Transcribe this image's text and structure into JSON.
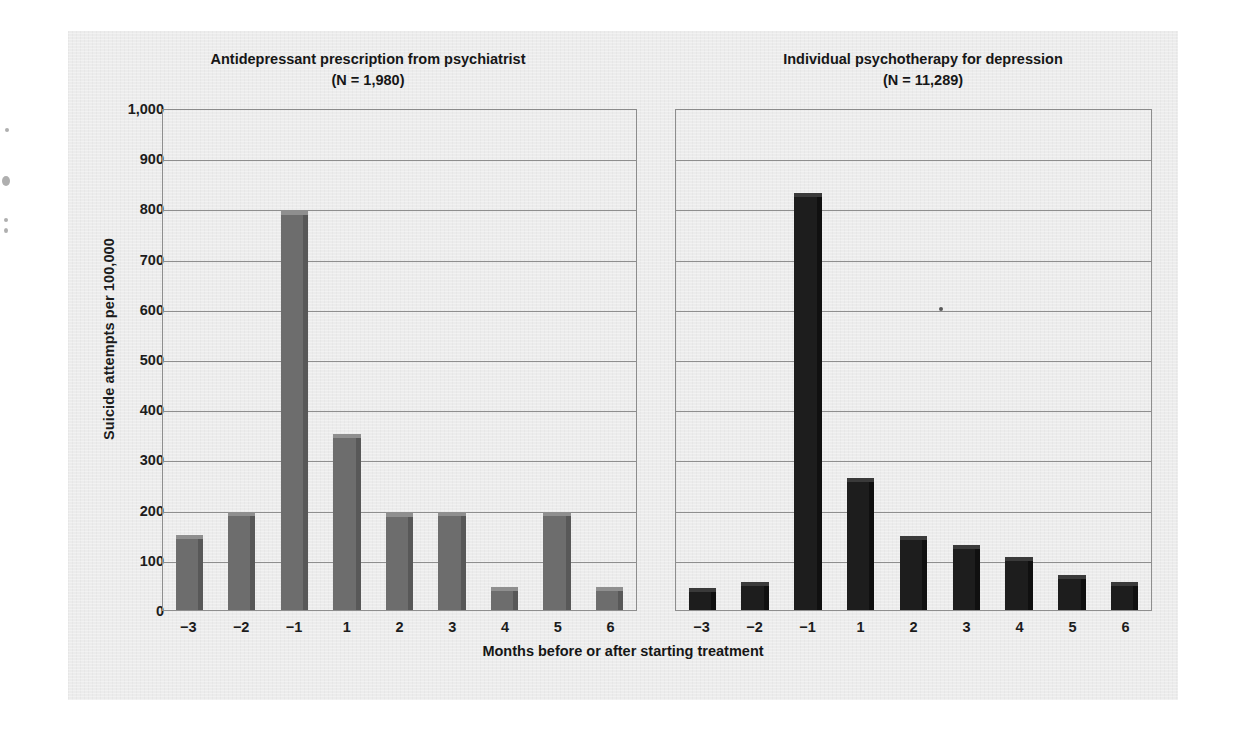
{
  "figure": {
    "y_axis_title": "Suicide attempts per 100,000",
    "x_axis_title": "Months before or after starting treatment"
  },
  "chart_data": [
    {
      "type": "bar",
      "title": "Antidepressant prescription from psychiatrist",
      "subtitle": "(N = 1,980)",
      "xlabel": "Months before or after starting treatment",
      "ylabel": "Suicide attempts per 100,000",
      "categories": [
        "−3",
        "−2",
        "−1",
        "1",
        "2",
        "3",
        "4",
        "5",
        "6"
      ],
      "values": [
        150,
        195,
        795,
        350,
        193,
        195,
        45,
        195,
        45
      ],
      "ylim": [
        0,
        1000
      ],
      "yticks": [
        0,
        100,
        200,
        300,
        400,
        500,
        600,
        700,
        800,
        900,
        1000
      ],
      "ytick_labels": [
        "0",
        "100",
        "200",
        "300",
        "400",
        "500",
        "600",
        "700",
        "800",
        "900",
        "1,000"
      ],
      "grid": true,
      "legend": "none",
      "bar_color": "#6d6d6d"
    },
    {
      "type": "bar",
      "title": "Individual psychotherapy for depression",
      "subtitle": "(N = 11,289)",
      "xlabel": "Months before or after starting treatment",
      "ylabel": "Suicide attempts per 100,000",
      "categories": [
        "−3",
        "−2",
        "−1",
        "1",
        "2",
        "3",
        "4",
        "5",
        "6"
      ],
      "values": [
        43,
        55,
        830,
        262,
        147,
        130,
        105,
        70,
        55
      ],
      "ylim": [
        0,
        1000
      ],
      "yticks": [
        0,
        100,
        200,
        300,
        400,
        500,
        600,
        700,
        800,
        900,
        1000
      ],
      "ytick_labels": [
        "0",
        "100",
        "200",
        "300",
        "400",
        "500",
        "600",
        "700",
        "800",
        "900",
        "1,000"
      ],
      "grid": true,
      "legend": "none",
      "bar_color": "#1d1d1d"
    }
  ]
}
